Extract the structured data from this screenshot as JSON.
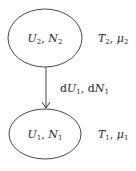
{
  "diagram": {
    "top_node": {
      "label_U": "U",
      "label_U_sub": "2",
      "label_N": "N",
      "label_N_sub": "2",
      "side_T": "T",
      "side_T_sub": "2",
      "side_mu": "μ",
      "side_mu_sub": "2"
    },
    "bottom_node": {
      "label_U": "U",
      "label_U_sub": "1",
      "label_N": "N",
      "label_N_sub": "1",
      "side_T": "T",
      "side_T_sub": "1",
      "side_mu": "μ",
      "side_mu_sub": "1"
    },
    "arrow": {
      "d1": "d",
      "U": "U",
      "U_sub": "1",
      "d2": "d",
      "N": "N",
      "N_sub": "1",
      "comma": ","
    },
    "colors": {
      "stroke": "#333333",
      "text": "#2a2a2a"
    }
  }
}
